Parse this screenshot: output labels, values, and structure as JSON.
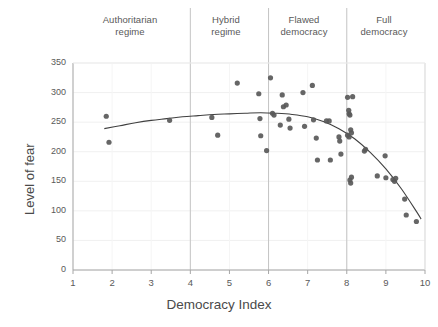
{
  "chart_data": {
    "type": "scatter",
    "title": "",
    "xlabel": "Democracy Index",
    "ylabel": "Level of fear",
    "xlim": [
      1,
      10
    ],
    "ylim": [
      0,
      350
    ],
    "xticks": [
      "1",
      "2",
      "3",
      "4",
      "5",
      "6",
      "7",
      "8",
      "9",
      "10"
    ],
    "yticks": [
      "0",
      "50",
      "100",
      "150",
      "200",
      "250",
      "300",
      "350"
    ],
    "grid": "light horizontal and vertical gridlines",
    "legend": "none",
    "marker_color": "#595959",
    "trendline_color": "#404040",
    "divider_color": "#bfbfbf",
    "regime_bands": [
      {
        "label": "Authoritarian\nregime",
        "x_start": 1,
        "x_end": 4
      },
      {
        "label": "Hybrid\nregime",
        "x_start": 4,
        "x_end": 6
      },
      {
        "label": "Flawed\ndemocracy",
        "x_start": 6,
        "x_end": 8
      },
      {
        "label": "Full\ndemocracy",
        "x_start": 8,
        "x_end": 10
      }
    ],
    "dividers": [
      4,
      6,
      8
    ],
    "points": [
      [
        1.85,
        260
      ],
      [
        1.92,
        216
      ],
      [
        3.47,
        253
      ],
      [
        4.55,
        258
      ],
      [
        4.7,
        228
      ],
      [
        5.2,
        316
      ],
      [
        5.75,
        298
      ],
      [
        5.78,
        256
      ],
      [
        5.8,
        227
      ],
      [
        5.95,
        202
      ],
      [
        6.05,
        325
      ],
      [
        6.1,
        265
      ],
      [
        6.14,
        262
      ],
      [
        6.3,
        245
      ],
      [
        6.35,
        296
      ],
      [
        6.38,
        276
      ],
      [
        6.45,
        279
      ],
      [
        6.52,
        255
      ],
      [
        6.55,
        240
      ],
      [
        6.88,
        300
      ],
      [
        6.92,
        243
      ],
      [
        7.12,
        312
      ],
      [
        7.15,
        254
      ],
      [
        7.22,
        223
      ],
      [
        7.25,
        186
      ],
      [
        7.48,
        252
      ],
      [
        7.55,
        252
      ],
      [
        7.58,
        186
      ],
      [
        7.8,
        225
      ],
      [
        7.82,
        218
      ],
      [
        7.85,
        196
      ],
      [
        8.02,
        292
      ],
      [
        8.05,
        270
      ],
      [
        8.06,
        264
      ],
      [
        8.08,
        262
      ],
      [
        8.1,
        237
      ],
      [
        8.02,
        228
      ],
      [
        8.06,
        225
      ],
      [
        8.12,
        232
      ],
      [
        8.15,
        293
      ],
      [
        8.08,
        152
      ],
      [
        8.1,
        147
      ],
      [
        8.12,
        157
      ],
      [
        8.45,
        201
      ],
      [
        8.48,
        204
      ],
      [
        8.78,
        159
      ],
      [
        9.0,
        156
      ],
      [
        8.98,
        193
      ],
      [
        9.18,
        153
      ],
      [
        9.22,
        150
      ],
      [
        9.25,
        155
      ],
      [
        9.48,
        120
      ],
      [
        9.52,
        93
      ],
      [
        9.78,
        82
      ]
    ],
    "trendline": [
      [
        1.8,
        239
      ],
      [
        2.2,
        244
      ],
      [
        2.6,
        249
      ],
      [
        3.0,
        253
      ],
      [
        3.4,
        256
      ],
      [
        3.8,
        259
      ],
      [
        4.2,
        261
      ],
      [
        4.6,
        263
      ],
      [
        5.0,
        264
      ],
      [
        5.4,
        265
      ],
      [
        5.8,
        266
      ],
      [
        6.2,
        265
      ],
      [
        6.6,
        263
      ],
      [
        7.0,
        259
      ],
      [
        7.4,
        251
      ],
      [
        7.8,
        239
      ],
      [
        8.2,
        222
      ],
      [
        8.6,
        199
      ],
      [
        9.0,
        171
      ],
      [
        9.4,
        137
      ],
      [
        9.8,
        97
      ],
      [
        9.9,
        86
      ]
    ]
  }
}
